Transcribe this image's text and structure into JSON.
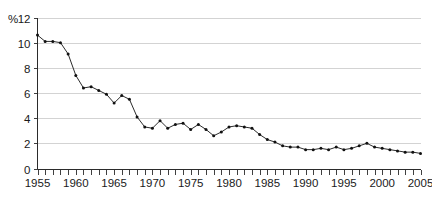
{
  "chart_data": {
    "type": "line",
    "title": "",
    "xlabel": "",
    "ylabel": "%",
    "yaxis_unit_label": "%",
    "xlim": [
      1955,
      2005
    ],
    "ylim": [
      0,
      12
    ],
    "ytick_values": [
      0,
      2,
      4,
      6,
      8,
      10,
      12
    ],
    "ytick_labels": [
      "0",
      "2",
      "4",
      "6",
      "8",
      "10",
      "12"
    ],
    "xtick_labels": [
      "1955",
      "1960",
      "1965",
      "1970",
      "1975",
      "1980",
      "1985",
      "1990",
      "1995",
      "2000",
      "2005"
    ],
    "xtick_label_values": [
      1955,
      1960,
      1965,
      1970,
      1975,
      1980,
      1985,
      1990,
      1995,
      2000,
      2005
    ],
    "minor_tick_interval": 1,
    "grid": true,
    "grid_axis": "y",
    "legend": false,
    "legend_position": "none",
    "marker": "circle",
    "line_color": "#2b2b2b",
    "marker_color": "#111111",
    "grid_color": "#c8c8c8",
    "axis_color": "#2b2b2b",
    "background_color": "#ffffff",
    "x": [
      1955,
      1956,
      1957,
      1958,
      1959,
      1960,
      1961,
      1962,
      1963,
      1964,
      1965,
      1966,
      1967,
      1968,
      1969,
      1970,
      1971,
      1972,
      1973,
      1974,
      1975,
      1976,
      1977,
      1978,
      1979,
      1980,
      1981,
      1982,
      1983,
      1984,
      1985,
      1986,
      1987,
      1988,
      1989,
      1990,
      1991,
      1992,
      1993,
      1994,
      1995,
      1996,
      1997,
      1998,
      1999,
      2000,
      2001,
      2002,
      2003,
      2004,
      2005
    ],
    "series": [
      {
        "name": "value",
        "values": [
          10.6,
          10.1,
          10.1,
          10.0,
          9.1,
          7.4,
          6.4,
          6.5,
          6.2,
          5.9,
          5.2,
          5.8,
          5.5,
          4.1,
          3.3,
          3.2,
          3.8,
          3.2,
          3.5,
          3.6,
          3.1,
          3.5,
          3.1,
          2.6,
          2.9,
          3.3,
          3.4,
          3.3,
          3.2,
          2.7,
          2.3,
          2.1,
          1.8,
          1.7,
          1.7,
          1.5,
          1.5,
          1.6,
          1.5,
          1.7,
          1.5,
          1.6,
          1.8,
          2.0,
          1.7,
          1.6,
          1.5,
          1.4,
          1.3,
          1.3,
          1.2
        ]
      }
    ]
  }
}
